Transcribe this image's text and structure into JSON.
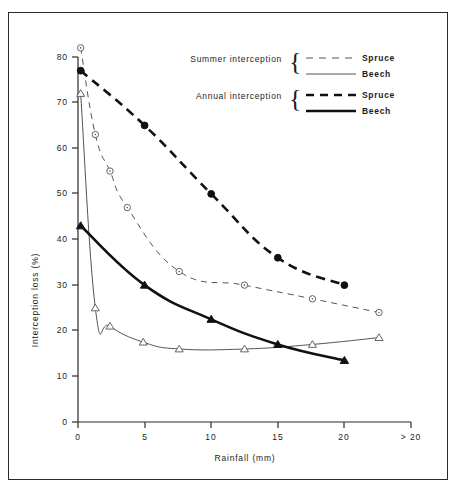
{
  "chart_data": {
    "type": "line",
    "title": "",
    "xlabel": "Rainfall  (mm)",
    "ylabel": "Interception  loss  (%)",
    "xlim": [
      0,
      25
    ],
    "ylim": [
      0,
      85
    ],
    "grid": false,
    "legend_position": "upper-center",
    "x_tick_labels": [
      "0",
      "5",
      "10",
      "15",
      "20",
      "> 20"
    ],
    "x_tick_values": [
      0,
      5,
      10,
      15,
      20,
      25
    ],
    "y_tick_labels": [
      "0",
      "10",
      "20",
      "30",
      "40",
      "50",
      "60",
      "70",
      "80"
    ],
    "y_tick_values": [
      0,
      10,
      20,
      30,
      40,
      50,
      60,
      70,
      80
    ],
    "series": [
      {
        "name": "Summer interception - Spruce",
        "group": "Summer interception",
        "species": "Spruce",
        "marker": "open-circle",
        "line_style": "dashed",
        "line_width": "thin",
        "color": "#555555",
        "x": [
          0.2,
          1.3,
          2.4,
          3.7,
          7.6,
          12.5,
          17.6,
          22.6
        ],
        "y": [
          82,
          63,
          55,
          47,
          33,
          30,
          27,
          24
        ]
      },
      {
        "name": "Summer interception - Beech",
        "group": "Summer interception",
        "species": "Beech",
        "marker": "open-triangle",
        "line_style": "solid",
        "line_width": "thin",
        "color": "#555555",
        "x": [
          0.2,
          1.3,
          2.4,
          4.9,
          7.6,
          12.5,
          17.6,
          22.6
        ],
        "y": [
          72,
          25,
          21,
          17.5,
          16,
          16,
          17,
          18.5
        ]
      },
      {
        "name": "Annual interception - Spruce",
        "group": "Annual interception",
        "species": "Spruce",
        "marker": "filled-circle",
        "line_style": "dashed",
        "line_width": "thick",
        "color": "#111111",
        "x": [
          0.2,
          5,
          10,
          15,
          20
        ],
        "y": [
          77,
          65,
          50,
          36,
          30
        ]
      },
      {
        "name": "Annual interception - Beech",
        "group": "Annual interception",
        "species": "Beech",
        "marker": "filled-triangle",
        "line_style": "solid",
        "line_width": "thick",
        "color": "#111111",
        "x": [
          0.2,
          5,
          10,
          15,
          20
        ],
        "y": [
          43,
          30,
          22.5,
          17,
          13.5
        ]
      }
    ]
  },
  "axes": {
    "y_title": "Interception  loss  (%)",
    "x_title": "Rainfall  (mm)",
    "y_ticks": [
      "80",
      "70",
      "60",
      "50",
      "40",
      "30",
      "20",
      "10",
      "0"
    ],
    "x_ticks": [
      "0",
      "5",
      "10",
      "15",
      "20",
      "> 20"
    ]
  },
  "legend": {
    "rows": [
      {
        "group_label": "Summer interception",
        "spruce_label": "Spruce",
        "beech_label": "Beech"
      },
      {
        "group_label": "Annual interception",
        "spruce_label": "Spruce",
        "beech_label": "Beech"
      }
    ],
    "brace": "{"
  }
}
